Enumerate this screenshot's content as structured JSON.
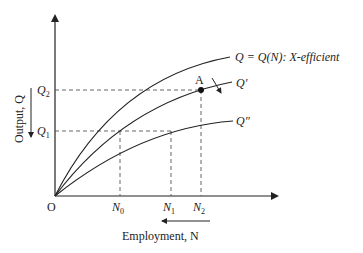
{
  "diagram": {
    "axes": {
      "origin_label": "O",
      "x_label": "Employment, N",
      "y_label": "Output, Q"
    },
    "y_ticks": [
      {
        "base": "Q",
        "sub": "2"
      },
      {
        "base": "Q",
        "sub": "1"
      }
    ],
    "x_ticks": [
      {
        "base": "N",
        "sub": "0"
      },
      {
        "base": "N",
        "sub": "1"
      },
      {
        "base": "N",
        "sub": "2"
      }
    ],
    "curves": [
      {
        "name": "x-efficient",
        "label": "Q = Q(N): X-efficient"
      },
      {
        "name": "q-prime",
        "label": "Q'"
      },
      {
        "name": "q-double-prime",
        "label": "Q\""
      }
    ],
    "point": {
      "label": "A"
    },
    "colors": {
      "line": "#222222",
      "dashed": "#555555",
      "background": "#ffffff"
    }
  }
}
